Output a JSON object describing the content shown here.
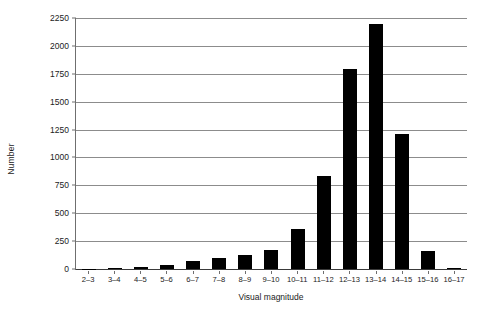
{
  "chart_data": {
    "type": "bar",
    "title": "",
    "xlabel": "Visual magnitude",
    "ylabel": "Number",
    "categories": [
      "2–3",
      "3–4",
      "4–5",
      "5–6",
      "6–7",
      "7–8",
      "8–9",
      "9–10",
      "10–11",
      "11–12",
      "12–13",
      "13–14",
      "14–15",
      "15–16",
      "16–17"
    ],
    "values": [
      2,
      8,
      22,
      40,
      70,
      100,
      130,
      170,
      355,
      830,
      1790,
      2200,
      1210,
      160,
      10
    ],
    "ylim": [
      0,
      2250
    ],
    "ytick_values": [
      0,
      250,
      500,
      750,
      1000,
      1250,
      1500,
      1750,
      2000,
      2250
    ],
    "ytick_labels": [
      "0",
      "250",
      "500",
      "750",
      "1000",
      "1250",
      "1500",
      "1750",
      "2000",
      "2250"
    ],
    "grid": "horizontal",
    "legend": "none",
    "bar_color": "#000000",
    "grid_color": "#8c8c8c",
    "axis_color": "#3a3a3a",
    "background": "#ffffff"
  }
}
